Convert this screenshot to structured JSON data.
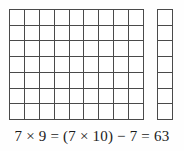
{
  "figure": {
    "name": "multiplication-array-diagram",
    "background_color": "#ffffff",
    "line_color": "#4a4a4a",
    "text_color": "#1a1a1a"
  },
  "main_grid": {
    "label": "7 by 9 array of unit squares",
    "rows": 7,
    "columns": 9,
    "total_cells": 63
  },
  "extra_column": {
    "label": "extra column of 7 unit squares",
    "rows": 7,
    "columns": 1,
    "total_cells": 7
  },
  "equation": {
    "text": "7 × 9 = (7 × 10) − 7 = 63",
    "left_factor": 7,
    "right_factor": 9,
    "product": 63,
    "rounded_factor": 10,
    "adjustment": 7
  },
  "chart_data": {
    "type": "table",
    "title": "7 × 9 = (7 × 10) − 7 = 63",
    "blocks": [
      {
        "name": "main-grid",
        "rows": 7,
        "columns": 9,
        "cells": 63
      },
      {
        "name": "extra-column",
        "rows": 7,
        "columns": 1,
        "cells": 7
      }
    ],
    "combined_rows": 7,
    "combined_columns": 10,
    "combined_cells": 70,
    "values": [
      63,
      7
    ],
    "categories": [
      "7 × 9",
      "7 × 1"
    ],
    "xlabel": "",
    "ylabel": "",
    "grid": true,
    "legend": "none"
  }
}
